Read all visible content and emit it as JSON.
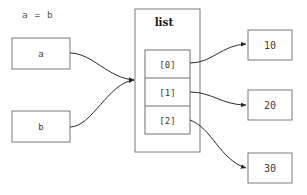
{
  "diagram": {
    "title": "a = b",
    "type": "object-reference-diagram",
    "canvas": {
      "width": 307,
      "height": 195,
      "background": "#ffffff"
    },
    "colors": {
      "box_stroke": "#7a7a7a",
      "inner_stroke": "#6e6e6e",
      "connector": "#2a2a2a",
      "text": "#3c3c3c",
      "title_text": "#555555",
      "container_title_text": "#1a1a1a",
      "background": "#ffffff"
    },
    "variables": [
      {
        "id": "var-a",
        "label": "a",
        "x": 12,
        "y": 38,
        "width": 58,
        "height": 31
      },
      {
        "id": "var-b",
        "label": "b",
        "x": 12,
        "y": 111,
        "width": 58,
        "height": 31
      }
    ],
    "container": {
      "id": "list-container",
      "label": "list",
      "x": 135,
      "y": 9,
      "width": 65,
      "height": 143,
      "label_x": 164,
      "label_y": 25
    },
    "cells": [
      {
        "id": "cell-0",
        "label": "[0]",
        "x": 145,
        "y": 50,
        "width": 45,
        "height": 28
      },
      {
        "id": "cell-1",
        "label": "[1]",
        "x": 145,
        "y": 78,
        "width": 45,
        "height": 28
      },
      {
        "id": "cell-2",
        "label": "[2]",
        "x": 145,
        "y": 106,
        "width": 45,
        "height": 28
      }
    ],
    "values": [
      {
        "id": "value-10",
        "label": "10",
        "x": 248,
        "y": 30,
        "width": 44,
        "height": 30
      },
      {
        "id": "value-20",
        "label": "20",
        "x": 248,
        "y": 90,
        "width": 44,
        "height": 30
      },
      {
        "id": "value-30",
        "label": "30",
        "x": 248,
        "y": 153,
        "width": 44,
        "height": 30
      }
    ],
    "connectors": [
      {
        "id": "edge-a-to-list",
        "from": "var-a",
        "to": "list-container",
        "path": "M70,53 C92,53 108,78 134,80"
      },
      {
        "id": "edge-b-to-list",
        "from": "var-b",
        "to": "list-container",
        "path": "M70,127 C92,127 108,83 134,80"
      },
      {
        "id": "edge-cell0-to-10",
        "from": "cell-0",
        "to": "value-10",
        "path": "M190,63 C212,63 222,45 246,44"
      },
      {
        "id": "edge-cell1-to-20",
        "from": "cell-1",
        "to": "value-20",
        "path": "M190,92 C212,92 222,105 246,105"
      },
      {
        "id": "edge-cell2-to-30",
        "from": "cell-2",
        "to": "value-30",
        "path": "M190,120 C212,128 220,160 246,168"
      }
    ]
  }
}
